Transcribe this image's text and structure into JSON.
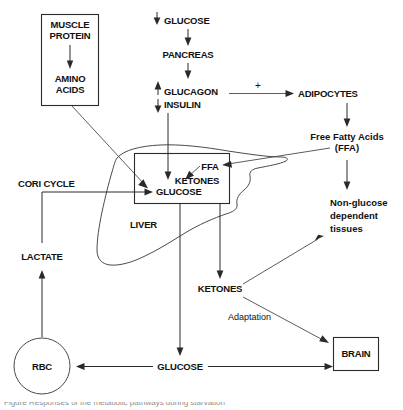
{
  "diagram": {
    "nodes": {
      "muscle_protein": "MUSCLE\nPROTEIN",
      "muscle_protein_line1": "MUSCLE",
      "muscle_protein_line2": "PROTEIN",
      "amino_acids_line1": "AMINO",
      "amino_acids_line2": "ACIDS",
      "glucose_top": "GLUCOSE",
      "pancreas": "PANCREAS",
      "glucagon": "GLUCAGON",
      "insulin": "INSULIN",
      "adipocytes": "ADIPOCYTES",
      "ffa_full_line1": "Free Fatty Acids",
      "ffa_full_line2": "(FFA)",
      "nonglucose_line1": "Non-glucose",
      "nonglucose_line2": "dependent",
      "nonglucose_line3": "tissues",
      "ffa_liver": "FFA",
      "ketones_liver": "KETONES",
      "glucose_liver": "GLUCOSE",
      "liver": "LIVER",
      "cori_cycle": "CORI CYCLE",
      "lactate": "LACTATE",
      "rbc": "RBC",
      "ketones_blood": "KETONES",
      "adaptation": "Adaptation",
      "brain": "BRAIN",
      "glucose_bottom": "GLUCOSE",
      "plus_sign": "+"
    },
    "arrow_markers": {
      "glucose_down_arrow": "↓",
      "glucagon_up_arrow": "↑",
      "insulin_down_arrow": "↓"
    },
    "colors": {
      "line": "#2a2a2a",
      "organ_outline": "#4a4a4a",
      "text": "#111111",
      "background": "#ffffff",
      "caption": "#8d8d8d"
    },
    "caption_partial": "Figure   Responses of the  metabolic pathways  during starvation"
  }
}
